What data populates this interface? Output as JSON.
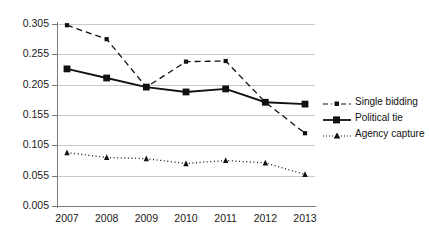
{
  "chart_data": {
    "type": "line",
    "title": "",
    "xlabel": "",
    "ylabel": "",
    "categories": [
      "2007",
      "2008",
      "2009",
      "2010",
      "2011",
      "2012",
      "2013"
    ],
    "x": [
      2007,
      2008,
      2009,
      2010,
      2011,
      2012,
      2013
    ],
    "ylim": [
      0.005,
      0.305
    ],
    "yticks": [
      "0.005",
      "0.055",
      "0.105",
      "0.155",
      "0.205",
      "0.255",
      "0.305"
    ],
    "ytick_values": [
      0.005,
      0.055,
      0.105,
      0.155,
      0.205,
      0.255,
      0.305
    ],
    "grid": true,
    "legend_position": "right",
    "series": [
      {
        "name": "Single bidding",
        "values": [
          0.303,
          0.28,
          0.201,
          0.243,
          0.244,
          0.176,
          0.125
        ],
        "line_style": "dashed",
        "marker": "small-square",
        "color": "#111111"
      },
      {
        "name": "Political tie",
        "values": [
          0.231,
          0.216,
          0.201,
          0.193,
          0.198,
          0.176,
          0.173
        ],
        "line_style": "solid",
        "marker": "square",
        "color": "#111111"
      },
      {
        "name": "Agency capture",
        "values": [
          0.093,
          0.085,
          0.083,
          0.075,
          0.08,
          0.076,
          0.057
        ],
        "line_style": "dotted",
        "marker": "triangle",
        "color": "#111111"
      }
    ]
  },
  "legend": {
    "items": [
      {
        "label": "Single bidding"
      },
      {
        "label": "Political tie"
      },
      {
        "label": "Agency capture"
      }
    ]
  },
  "colors": {
    "grid": "#c9c9c9",
    "axis": "#7a7a7a",
    "ink": "#111111"
  }
}
